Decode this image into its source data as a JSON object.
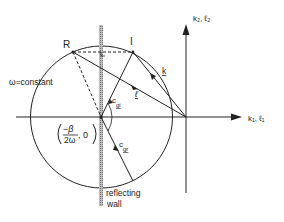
{
  "diagram": {
    "axes": {
      "horizontal_label": "k₁, ℓ₁",
      "vertical_label": "k₂, ℓ₂"
    },
    "circle_label": "ω=constant",
    "center_label_num": "−β",
    "center_label_den": "2ω",
    "center_label_tail": ", 0",
    "points": {
      "R": "R",
      "I": "I"
    },
    "vectors": {
      "k": "k",
      "l": "ℓ",
      "cgi": "c",
      "cgi_sub": "gi",
      "cgr": "c",
      "cgr_sub": "gr"
    },
    "wall_label_line1": "reflecting",
    "wall_label_line2": "wall",
    "colors": {
      "ink": "#222222",
      "wall": "#9a9a9a"
    }
  }
}
